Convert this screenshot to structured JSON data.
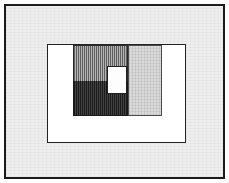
{
  "figure": {
    "kind": "nested-rectangle-diagram",
    "title": "",
    "caption": "",
    "width_px": 229,
    "height_px": 183,
    "background_color": "#ffffff"
  },
  "outer_frame": {
    "name": "outer-frame",
    "fill_color": "#eeeeee",
    "border_color": "#1c1c1c",
    "border_width_px": 2,
    "x": 4,
    "y": 4,
    "width": 221,
    "height": 175
  },
  "plot_rect": {
    "name": "plot-rectangle",
    "fill_color": "#ffffff",
    "border_color": "#232323",
    "border_width_px": 1,
    "x": 45,
    "y": 42,
    "width": 139,
    "height": 99
  },
  "blocks": [
    {
      "id": "white-left-strip",
      "label": "",
      "fill_color": "#ffffff",
      "pattern": "solid",
      "x": 0,
      "y": 0,
      "width": 25,
      "height": 97
    },
    {
      "id": "white-bottom-strip",
      "label": "",
      "fill_color": "#ffffff",
      "pattern": "solid",
      "x": 0,
      "y": 71,
      "width": 137,
      "height": 26
    },
    {
      "id": "white-right-strip",
      "label": "",
      "fill_color": "#ffffff",
      "pattern": "solid",
      "x": 114,
      "y": 0,
      "width": 23,
      "height": 71
    },
    {
      "id": "hatch-medium-block",
      "label": "",
      "fill_color": "#8e8e8e",
      "pattern": "vertical-hatch",
      "border_color": "#2a2a2a",
      "x": 25,
      "y": 0,
      "width": 55,
      "height": 36
    },
    {
      "id": "dark-block",
      "label": "",
      "fill_color": "#2e2e2e",
      "pattern": "dense-vertical-hatch",
      "border_color": "#1a1a1a",
      "x": 25,
      "y": 36,
      "width": 55,
      "height": 35
    },
    {
      "id": "light-gray-block",
      "label": "",
      "fill_color": "#d2d2d2",
      "pattern": "fine-texture",
      "border_color": "#4a4a4a",
      "x": 80,
      "y": 0,
      "width": 34,
      "height": 71
    },
    {
      "id": "white-center-square",
      "label": "",
      "fill_color": "#fdfdfd",
      "pattern": "solid",
      "border_color": "#1f1f1f",
      "x": 59,
      "y": 21,
      "width": 20,
      "height": 28
    }
  ],
  "palette": {
    "page_background": "#ffffff",
    "panel_background": "#eeeeee",
    "frame_stroke": "#1c1c1c",
    "plot_stroke": "#232323",
    "block_medium": "#8e8e8e",
    "block_dark": "#2e2e2e",
    "block_light": "#d2d2d2",
    "block_white": "#ffffff"
  }
}
